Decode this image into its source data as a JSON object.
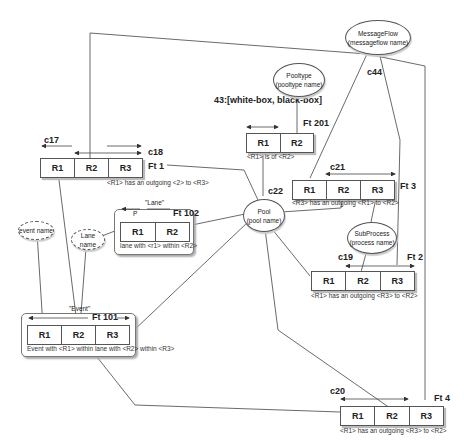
{
  "diagram": {
    "constraint_label": "43:[white-box, black-box]",
    "fact_types": [
      {
        "id": "ft1",
        "name": "Ft 1",
        "roles": [
          "R1",
          "R2",
          "R3"
        ],
        "reading": "<R1> has an outgoing <2> to <R3>",
        "constraints": [
          "c17",
          "c18"
        ]
      },
      {
        "id": "ft201",
        "name": "Ft 201",
        "roles": [
          "R1",
          "R2"
        ],
        "reading": "<R1> is of <R2>"
      },
      {
        "id": "ft3",
        "name": "Ft 3",
        "roles": [
          "R1",
          "R2",
          "R3"
        ],
        "reading": "<R3> has an outgoing <R1> to <R2>",
        "constraints": [
          "c21"
        ]
      },
      {
        "id": "ft102",
        "name": "Ft 102",
        "roles": [
          "R1",
          "R2"
        ],
        "reading": "lane with <r1> within <R2>",
        "group_label": "\"Lane\"",
        "marker": "P"
      },
      {
        "id": "ft2",
        "name": "Ft 2",
        "roles": [
          "R1",
          "R2",
          "R3"
        ],
        "reading": "<R1> has an outgoing <R3> to <R2>",
        "constraints": [
          "c19"
        ]
      },
      {
        "id": "ft101",
        "name": "Ft 101",
        "roles": [
          "R1",
          "R2",
          "R3"
        ],
        "reading": "Event with <R1> within lane with <R2> within <R3>",
        "group_label": "\"Event\""
      },
      {
        "id": "ft4",
        "name": "Ft 4",
        "roles": [
          "R1",
          "R2",
          "R3"
        ],
        "reading": "<R1> has an outgoing <R3> to <R2>",
        "constraints": [
          "c20"
        ]
      }
    ],
    "entities": [
      {
        "id": "messageflow",
        "line1": "MessageFlow",
        "line2": "(messageflow name)",
        "constraint": "c44"
      },
      {
        "id": "pooltype",
        "line1": "Pooltype",
        "line2": "(pooltype name)"
      },
      {
        "id": "pool",
        "line1": "Pool",
        "line2": "(pool name)",
        "constraint": "c22"
      },
      {
        "id": "subprocess",
        "line1": "SubProcess",
        "line2": "(process name)"
      }
    ],
    "value_types": [
      {
        "id": "event-name",
        "label": "event name"
      },
      {
        "id": "lane-name",
        "label": "Lane name"
      }
    ]
  }
}
